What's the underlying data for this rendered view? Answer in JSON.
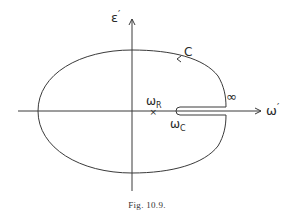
{
  "figure": {
    "caption": "Fig. 10.9.",
    "axes": {
      "vertical_label": "ε",
      "vertical_prime": "′",
      "horizontal_label": "ω",
      "horizontal_prime": "′"
    },
    "contour": {
      "label": "C",
      "infinity_label": "∞",
      "direction": "counter-clockwise"
    },
    "points": {
      "omega_r": {
        "base": "ω",
        "sub": "R",
        "marker": "×"
      },
      "omega_c": {
        "base": "ω",
        "sub": "C"
      }
    },
    "colors": {
      "line": "#3a3a3a",
      "text": "#2a2a2a",
      "background": "#ffffff"
    }
  }
}
